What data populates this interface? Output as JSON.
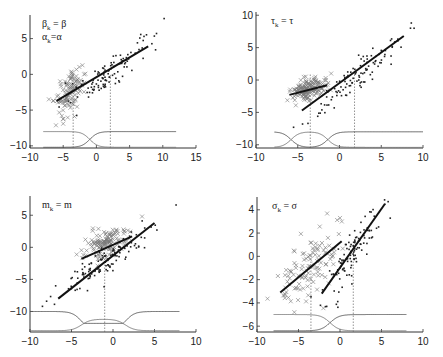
{
  "chart_data": [
    {
      "type": "scatter",
      "panel": "top-left",
      "label": {
        "lines": [
          {
            "base": "β",
            "sub": "k",
            "rest": " = β"
          },
          {
            "base": "α",
            "sub": "k",
            "rest": "=α"
          }
        ]
      },
      "box": {
        "left": 30,
        "right": 196,
        "top": 15,
        "bottom": 148
      },
      "xlim": [
        -10,
        15
      ],
      "ylim": [
        -10.3,
        8.3
      ],
      "xticks": [
        -10,
        -5,
        0,
        5,
        10,
        15
      ],
      "yticks": [
        -10,
        -5,
        0,
        5
      ],
      "clusters": [
        {
          "marker": "x",
          "n": 110,
          "cx": -4,
          "cy": -2.5,
          "sx": 1.1,
          "sy": 1.6,
          "rho": 0.45,
          "seed": 11
        },
        {
          "marker": "dot",
          "n": 110,
          "cx": 2.2,
          "cy": 0.5,
          "sx": 2.6,
          "sy": 2.1,
          "rho": 0.85,
          "seed": 23
        }
      ],
      "extra_points": [
        {
          "marker": "x",
          "x": -5.2,
          "y": -5.8
        },
        {
          "marker": "x",
          "x": -5.0,
          "y": -6.9
        },
        {
          "marker": "x",
          "x": -3.3,
          "y": -5.9
        },
        {
          "marker": "dot",
          "x": 10.2,
          "y": 7.8
        }
      ],
      "fit_lines": [
        {
          "x1": -6,
          "y1": -3.7,
          "x2": 7.8,
          "y2": 3.9
        }
      ],
      "gates": {
        "y_high": -8,
        "y_low": -10.2,
        "x_range": [
          -8,
          12
        ],
        "transitions": [
          {
            "x": -1,
            "w": 0.6
          }
        ],
        "pattern": "one-switch"
      },
      "vlines": [
        -3.5,
        2.1
      ]
    },
    {
      "type": "scatter",
      "panel": "top-right",
      "label": {
        "lines": [
          {
            "base": "τ",
            "sub": "k",
            "rest": " = τ"
          }
        ]
      },
      "box": {
        "left": 256,
        "right": 423,
        "top": 12,
        "bottom": 148
      },
      "xlim": [
        -10,
        10
      ],
      "ylim": [
        -10.5,
        10.5
      ],
      "xticks": [
        -10,
        -5,
        0,
        5,
        10
      ],
      "yticks": [
        -10,
        -5,
        0,
        5,
        10
      ],
      "clusters": [
        {
          "marker": "x",
          "n": 160,
          "cx": -3.8,
          "cy": -1.5,
          "sx": 1.0,
          "sy": 0.9,
          "rho": 0.35,
          "seed": 5
        },
        {
          "marker": "dot",
          "n": 110,
          "cx": 2.5,
          "cy": 1.0,
          "sx": 2.8,
          "sy": 3.2,
          "rho": 0.93,
          "seed": 7
        }
      ],
      "extra_points": [
        {
          "marker": "dot",
          "x": -5.5,
          "y": -7.3
        },
        {
          "marker": "dot",
          "x": 8.6,
          "y": 8.8
        },
        {
          "marker": "dot",
          "x": 8.5,
          "y": 8.0
        },
        {
          "marker": "x",
          "x": -1.0,
          "y": 1.0
        }
      ],
      "fit_lines": [
        {
          "x1": -4.5,
          "y1": -4.7,
          "x2": 7.7,
          "y2": 6.8
        },
        {
          "x1": -6,
          "y1": -2.3,
          "x2": -1.5,
          "y2": -0.8
        }
      ],
      "gates": {
        "y_high": -8,
        "y_low": -10.4,
        "x_range": [
          -7.8,
          10
        ],
        "transitions": [
          {
            "x": -5.8,
            "w": 0.5
          },
          {
            "x": -1.4,
            "w": 0.5
          }
        ],
        "pattern": "bump-then-high"
      },
      "vlines": [
        -3.5,
        1.8
      ]
    },
    {
      "type": "scatter",
      "panel": "bottom-left",
      "label": {
        "lines": [
          {
            "base": "m",
            "sub": "k",
            "rest": " = m"
          }
        ]
      },
      "box": {
        "left": 30,
        "right": 196,
        "top": 196,
        "bottom": 332
      },
      "xlim": [
        -10,
        10
      ],
      "ylim": [
        -13.2,
        8
      ],
      "xticks": [
        -10,
        -5,
        0,
        5,
        10
      ],
      "yticks": [
        -10,
        -5,
        0,
        5
      ],
      "clusters": [
        {
          "marker": "x",
          "n": 130,
          "cx": -0.8,
          "cy": 0.8,
          "sx": 1.2,
          "sy": 1.3,
          "rho": 0.3,
          "seed": 3
        },
        {
          "marker": "dot",
          "n": 120,
          "cx": -0.5,
          "cy": -1.8,
          "sx": 2.8,
          "sy": 2.6,
          "rho": 0.9,
          "seed": 17
        }
      ],
      "extra_points": [
        {
          "marker": "dot",
          "x": 7.6,
          "y": 6.6
        },
        {
          "marker": "dot",
          "x": -8.5,
          "y": -9.2
        },
        {
          "marker": "dot",
          "x": -8.0,
          "y": -8.4
        },
        {
          "marker": "x",
          "x": 3.5,
          "y": 4.8
        }
      ],
      "fit_lines": [
        {
          "x1": -6.6,
          "y1": -8.0,
          "x2": 5,
          "y2": 3.8
        },
        {
          "x1": -3.8,
          "y1": -1.8,
          "x2": 2.3,
          "y2": 1.7
        }
      ],
      "gates": {
        "y_high": -10,
        "y_low": -13,
        "x_range": [
          -10,
          8
        ],
        "transitions": [
          {
            "x": -3.8,
            "w": 0.55
          },
          {
            "x": 1.5,
            "w": 0.55
          }
        ],
        "pattern": "dip-and-bump"
      },
      "vlines": [
        -1
      ]
    },
    {
      "type": "scatter",
      "panel": "bottom-right",
      "label": {
        "lines": [
          {
            "base": "σ",
            "sub": "k",
            "rest": " = σ"
          }
        ]
      },
      "box": {
        "left": 257,
        "right": 423,
        "top": 197,
        "bottom": 332
      },
      "xlim": [
        -10,
        10
      ],
      "ylim": [
        -6.5,
        5.1
      ],
      "xticks": [
        -10,
        -5,
        0,
        5,
        10
      ],
      "yticks": [
        -6,
        -4,
        -2,
        0,
        2,
        4
      ],
      "clusters": [
        {
          "marker": "x",
          "n": 110,
          "cx": -3.5,
          "cy": -0.8,
          "sx": 2.0,
          "sy": 1.5,
          "rho": 0.55,
          "seed": 29
        },
        {
          "marker": "dot",
          "n": 110,
          "cx": 1.6,
          "cy": 0.4,
          "sx": 1.7,
          "sy": 2.0,
          "rho": 0.88,
          "seed": 31
        }
      ],
      "extra_points": [
        {
          "marker": "x",
          "x": -5.5,
          "y": -4.8
        },
        {
          "marker": "x",
          "x": 0,
          "y": 3.3
        },
        {
          "marker": "dot",
          "x": 5.8,
          "y": 4.7
        }
      ],
      "fit_lines": [
        {
          "x1": -7.2,
          "y1": -3.1,
          "x2": 0.2,
          "y2": 1.3
        },
        {
          "x1": -2.2,
          "y1": -3.2,
          "x2": 5.4,
          "y2": 4.5
        }
      ],
      "gates": {
        "y_high": -5,
        "y_low": -6.4,
        "x_range": [
          -8,
          8
        ],
        "transitions": [
          {
            "x": -1.2,
            "w": 0.55
          }
        ],
        "pattern": "one-switch"
      },
      "vlines": [
        -3.5,
        1.6
      ]
    }
  ]
}
